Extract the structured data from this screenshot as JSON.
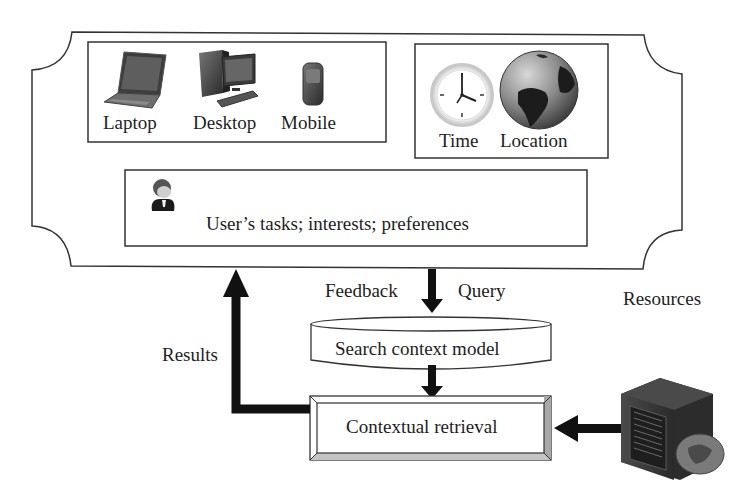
{
  "context_panel": {
    "devices": {
      "items": [
        {
          "label": "Laptop",
          "icon": "laptop-icon"
        },
        {
          "label": "Desktop",
          "icon": "desktop-computer-icon"
        },
        {
          "label": "Mobile",
          "icon": "mobile-phone-icon"
        }
      ]
    },
    "environment": {
      "items": [
        {
          "label": "Time",
          "icon": "clock-icon"
        },
        {
          "label": "Location",
          "icon": "globe-icon"
        }
      ]
    },
    "user": {
      "icon": "user-avatar-icon",
      "label": "User’s tasks; interests; preferences"
    }
  },
  "flow": {
    "feedback_label": "Feedback",
    "query_label": "Query",
    "results_label": "Results",
    "resources_label": "Resources",
    "search_context_model": "Search context model",
    "contextual_retrieval": "Contextual retrieval",
    "resources_icon": "server-database-icon"
  }
}
